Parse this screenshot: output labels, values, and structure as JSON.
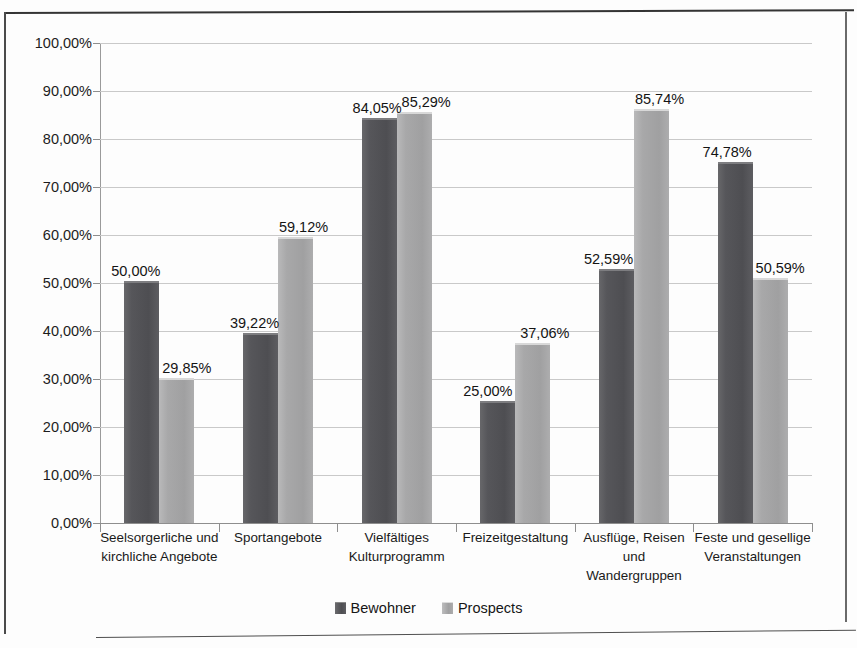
{
  "chart_data": {
    "type": "bar",
    "title": "",
    "xlabel": "",
    "ylabel": "",
    "ylim": [
      0,
      100
    ],
    "ytick_labels": [
      "100,00%",
      "90,00%",
      "80,00%",
      "70,00%",
      "60,00%",
      "50,00%",
      "40,00%",
      "30,00%",
      "20,00%",
      "10,00%",
      "0,00%"
    ],
    "ytick_values": [
      100,
      90,
      80,
      70,
      60,
      50,
      40,
      30,
      20,
      10,
      0
    ],
    "grid": true,
    "legend_position": "bottom",
    "categories": [
      "Seelsorgerliche und kirchliche Angebote",
      "Sportangebote",
      "Vielfältiges Kulturprogramm",
      "Freizeitgestaltung",
      "Ausflüge, Reisen und Wandergruppen",
      "Feste und gesellige Veranstaltungen"
    ],
    "series": [
      {
        "name": "Bewohner",
        "color": "#4e4e52",
        "values": [
          50.0,
          39.22,
          84.05,
          25.0,
          52.59,
          74.78
        ],
        "labels": [
          "50,00%",
          "39,22%",
          "84,05%",
          "25,00%",
          "52,59%",
          "74,78%"
        ]
      },
      {
        "name": "Prospects",
        "color": "#a0a0a1",
        "values": [
          29.85,
          59.12,
          85.29,
          37.06,
          85.74,
          50.59
        ],
        "labels": [
          "29,85%",
          "59,12%",
          "85,29%",
          "37,06%",
          "85,74%",
          "50,59%"
        ]
      }
    ]
  },
  "legend": {
    "items": [
      {
        "label": "Bewohner",
        "swatch": "bewohner-swatch-icon"
      },
      {
        "label": "Prospects",
        "swatch": "prospects-swatch-icon"
      }
    ]
  }
}
